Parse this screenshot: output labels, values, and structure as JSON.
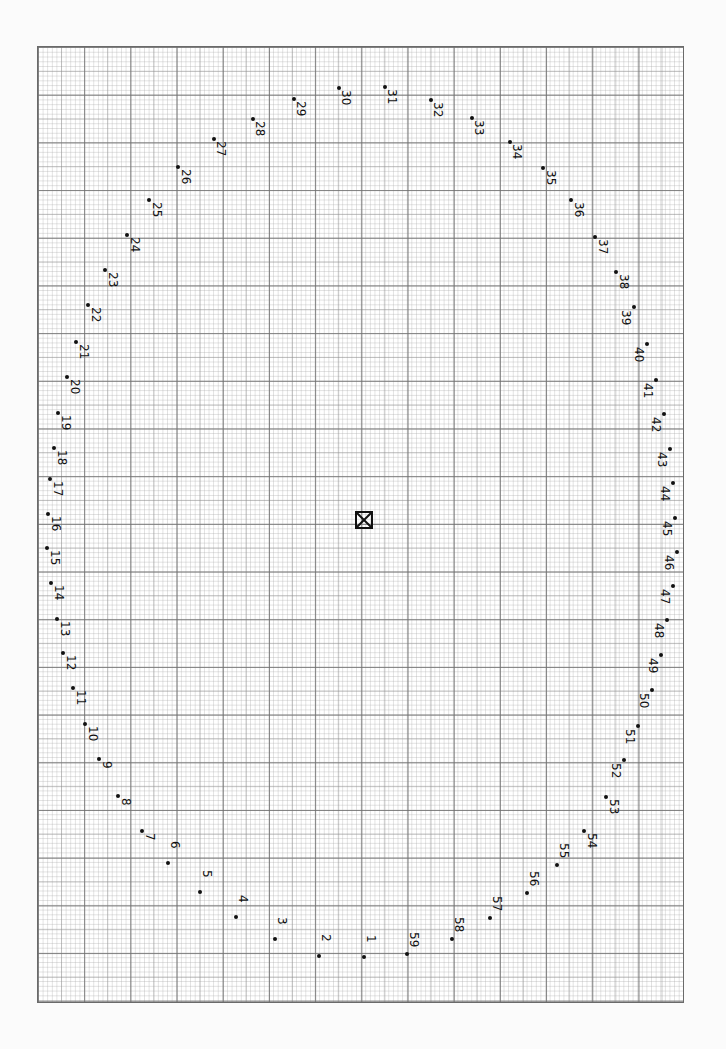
{
  "sheet": {
    "background": "#ffffff",
    "grid_major": "#6e6e6e",
    "grid_minor": "#aaaaaa"
  },
  "center_marker": {
    "icon": "boxed-x-icon",
    "x": 364,
    "y": 520
  },
  "points": [
    {
      "n": "1",
      "x": 364,
      "y": 957
    },
    {
      "n": "2",
      "x": 319,
      "y": 956
    },
    {
      "n": "3",
      "x": 275,
      "y": 939
    },
    {
      "n": "4",
      "x": 236,
      "y": 917
    },
    {
      "n": "5",
      "x": 200,
      "y": 892
    },
    {
      "n": "6",
      "x": 168,
      "y": 863
    },
    {
      "n": "7",
      "x": 142,
      "y": 831
    },
    {
      "n": "8",
      "x": 118,
      "y": 796
    },
    {
      "n": "9",
      "x": 99,
      "y": 759
    },
    {
      "n": "10",
      "x": 85,
      "y": 724
    },
    {
      "n": "11",
      "x": 73,
      "y": 688
    },
    {
      "n": "12",
      "x": 63,
      "y": 653
    },
    {
      "n": "13",
      "x": 57,
      "y": 619
    },
    {
      "n": "14",
      "x": 51,
      "y": 583
    },
    {
      "n": "15",
      "x": 47,
      "y": 548
    },
    {
      "n": "16",
      "x": 48,
      "y": 514
    },
    {
      "n": "17",
      "x": 50,
      "y": 479
    },
    {
      "n": "18",
      "x": 54,
      "y": 448
    },
    {
      "n": "19",
      "x": 58,
      "y": 413
    },
    {
      "n": "20",
      "x": 67,
      "y": 377
    },
    {
      "n": "21",
      "x": 76,
      "y": 342
    },
    {
      "n": "22",
      "x": 88,
      "y": 305
    },
    {
      "n": "23",
      "x": 105,
      "y": 270
    },
    {
      "n": "24",
      "x": 127,
      "y": 235
    },
    {
      "n": "25",
      "x": 149,
      "y": 200
    },
    {
      "n": "26",
      "x": 178,
      "y": 167
    },
    {
      "n": "27",
      "x": 214,
      "y": 139
    },
    {
      "n": "28",
      "x": 253,
      "y": 119
    },
    {
      "n": "29",
      "x": 294,
      "y": 99
    },
    {
      "n": "30",
      "x": 339,
      "y": 88
    },
    {
      "n": "31",
      "x": 385,
      "y": 87
    },
    {
      "n": "32",
      "x": 431,
      "y": 100
    },
    {
      "n": "33",
      "x": 472,
      "y": 118
    },
    {
      "n": "34",
      "x": 510,
      "y": 142
    },
    {
      "n": "35",
      "x": 543,
      "y": 168
    },
    {
      "n": "36",
      "x": 571,
      "y": 200
    },
    {
      "n": "37",
      "x": 595,
      "y": 237
    },
    {
      "n": "38",
      "x": 616,
      "y": 272
    },
    {
      "n": "39",
      "x": 634,
      "y": 307
    },
    {
      "n": "40",
      "x": 647,
      "y": 344
    },
    {
      "n": "41",
      "x": 656,
      "y": 380
    },
    {
      "n": "42",
      "x": 664,
      "y": 414
    },
    {
      "n": "43",
      "x": 670,
      "y": 449
    },
    {
      "n": "44",
      "x": 673,
      "y": 483
    },
    {
      "n": "45",
      "x": 675,
      "y": 518
    },
    {
      "n": "46",
      "x": 677,
      "y": 552
    },
    {
      "n": "47",
      "x": 673,
      "y": 586
    },
    {
      "n": "48",
      "x": 667,
      "y": 620
    },
    {
      "n": "49",
      "x": 661,
      "y": 655
    },
    {
      "n": "50",
      "x": 652,
      "y": 690
    },
    {
      "n": "51",
      "x": 638,
      "y": 726
    },
    {
      "n": "52",
      "x": 624,
      "y": 760
    },
    {
      "n": "53",
      "x": 606,
      "y": 797
    },
    {
      "n": "54",
      "x": 584,
      "y": 831
    },
    {
      "n": "55",
      "x": 557,
      "y": 865
    },
    {
      "n": "56",
      "x": 527,
      "y": 893
    },
    {
      "n": "57",
      "x": 490,
      "y": 918
    },
    {
      "n": "58",
      "x": 452,
      "y": 939
    },
    {
      "n": "59",
      "x": 407,
      "y": 954
    }
  ]
}
